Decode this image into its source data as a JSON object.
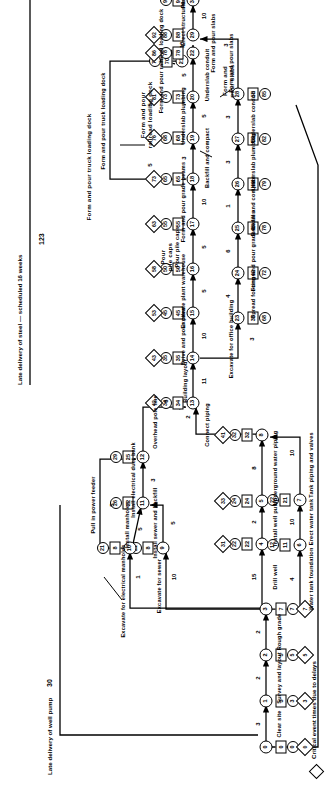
{
  "figure": {
    "type": "pert-cpm-network",
    "orientation": "rotated-90-ccw",
    "legend": {
      "critical_note": "Critical event times due to delays",
      "diamond_symbol": "diamond-marker"
    },
    "annotations": [
      {
        "id": "ann-well-pump",
        "text": "Late delivery of well pump",
        "value": "30"
      },
      {
        "id": "ann-steel",
        "text": "Late delivery of steel — scheduled 16 weeks",
        "value": "123"
      }
    ]
  },
  "events": [
    {
      "n": "0",
      "diamond": "0",
      "circle": "0",
      "square": "0"
    },
    {
      "n": "1",
      "diamond": "3",
      "circle": "3",
      "square": "3"
    },
    {
      "n": "2",
      "diamond": "5",
      "circle": "5",
      "square": "5"
    },
    {
      "n": "3",
      "diamond": "7",
      "circle": "7",
      "square": "7"
    },
    {
      "n": "4",
      "diamond": "31",
      "circle": "22",
      "square": "22"
    },
    {
      "n": "5",
      "diamond": "33",
      "circle": "24",
      "square": "24"
    },
    {
      "n": "6",
      "diamond": "",
      "circle": "12",
      "square": "11"
    },
    {
      "n": "7",
      "diamond": "",
      "circle": "22",
      "square": "21"
    },
    {
      "n": "8",
      "diamond": "41",
      "circle": "32",
      "square": "32"
    },
    {
      "n": "9",
      "diamond": "",
      "circle": "21",
      "square": "8"
    },
    {
      "n": "10",
      "diamond": "",
      "circle": "21",
      "square": "8"
    },
    {
      "n": "11",
      "diamond": "",
      "circle": "26",
      "square": "22"
    },
    {
      "n": "12",
      "diamond": "",
      "circle": "29",
      "square": "25"
    },
    {
      "n": "13",
      "diamond": "42",
      "circle": "34",
      "square": "34"
    },
    {
      "n": "14",
      "diamond": "43",
      "circle": "35",
      "square": "35"
    },
    {
      "n": "15",
      "diamond": "53",
      "circle": "45",
      "square": "45"
    },
    {
      "n": "16",
      "diamond": "58",
      "circle": "50",
      "square": "50"
    },
    {
      "n": "17",
      "diamond": "63",
      "circle": "55",
      "square": "55"
    },
    {
      "n": "18",
      "diamond": "73",
      "circle": "65",
      "square": "65"
    },
    {
      "n": "19",
      "diamond": "76",
      "circle": "68",
      "square": "68"
    },
    {
      "n": "20",
      "diamond": "81",
      "circle": "73",
      "square": "73"
    },
    {
      "n": "21",
      "diamond": "",
      "circle": "78",
      "square": "70"
    },
    {
      "n": "22",
      "diamond": "86",
      "circle": "78",
      "square": "78"
    },
    {
      "n": "23",
      "diamond": "",
      "circle": "68",
      "square": "38"
    },
    {
      "n": "24",
      "diamond": "",
      "circle": "72",
      "square": "42"
    },
    {
      "n": "25",
      "diamond": "",
      "circle": "78",
      "square": "48"
    },
    {
      "n": "26",
      "diamond": "",
      "circle": "79",
      "square": "49"
    },
    {
      "n": "27",
      "diamond": "",
      "circle": "82",
      "square": "52"
    },
    {
      "n": "28",
      "diamond": "",
      "circle": "85",
      "square": "55"
    },
    {
      "n": "29",
      "diamond": "92",
      "circle": "88",
      "square": "88"
    },
    {
      "n": "30",
      "diamond": "",
      "circle": "98",
      "square": "98"
    },
    {
      "n": "31",
      "diamond": "",
      "circle": "113",
      "square": "103"
    }
  ],
  "activities": [
    {
      "from": "0",
      "to": "1",
      "label": "Clear site",
      "duration": "3"
    },
    {
      "from": "1",
      "to": "2",
      "label": "Survey and layout",
      "duration": "2"
    },
    {
      "from": "2",
      "to": "3",
      "label": "Rough grade",
      "duration": "2"
    },
    {
      "from": "3",
      "to": "4",
      "label": "Drill well",
      "duration": "15"
    },
    {
      "from": "4",
      "to": "5",
      "label": "Install well pump",
      "duration": "2"
    },
    {
      "from": "3",
      "to": "6",
      "label": "Water tank foundation",
      "duration": "4"
    },
    {
      "from": "6",
      "to": "7",
      "label": "Erect water tank",
      "duration": "10"
    },
    {
      "from": "5",
      "to": "8",
      "label": "Underground water piping",
      "duration": "8"
    },
    {
      "from": "7",
      "to": "8",
      "label": "Tank piping and valves",
      "duration": "10"
    },
    {
      "from": "3",
      "to": "9",
      "label": "Excavate for sewer",
      "duration": "10"
    },
    {
      "from": "9",
      "to": "11",
      "label": "Install sewer and backfill",
      "duration": "5"
    },
    {
      "from": "3",
      "to": "10",
      "label": "Excavate for electrical manholes",
      "duration": "1"
    },
    {
      "from": "10",
      "to": "11",
      "label": "Install manholes",
      "duration": "5"
    },
    {
      "from": "11",
      "to": "12",
      "label": "Install electrical duct bank",
      "duration": "3"
    },
    {
      "from": "10",
      "to": "12",
      "label": "Pull in power feeder",
      "duration": "5"
    },
    {
      "from": "12",
      "to": "13",
      "label": "Overhead pole line",
      "duration": "6"
    },
    {
      "from": "8",
      "to": "13",
      "label": "Connect piping",
      "duration": "2"
    },
    {
      "from": "13",
      "to": "14",
      "label": "Building layout",
      "duration": "11"
    },
    {
      "from": "14",
      "to": "15",
      "label": "Drive and pour piles",
      "duration": "10"
    },
    {
      "from": "15",
      "to": "16",
      "label": "Excavate plant warehouse",
      "duration": "5"
    },
    {
      "from": "16",
      "to": "17",
      "label": "Pour pile caps",
      "duration": "5"
    },
    {
      "from": "17",
      "to": "18",
      "label": "Form and pour grade beams",
      "duration": "10"
    },
    {
      "from": "18",
      "to": "19",
      "label": "Backfill and compact",
      "duration": "3"
    },
    {
      "from": "19",
      "to": "20",
      "label": "Underslab plumbing",
      "duration": "5"
    },
    {
      "from": "20",
      "to": "22",
      "label": "Underslab conduit",
      "duration": "5"
    },
    {
      "from": "21",
      "to": "22",
      "label": "Form and pour railroad loading dock",
      "duration": "5"
    },
    {
      "from": "18",
      "to": "21",
      "label": "Form and pour truck loading dock",
      "duration": "5"
    },
    {
      "from": "14",
      "to": "23",
      "label": "Excavate for office building",
      "duration": "3"
    },
    {
      "from": "23",
      "to": "24",
      "label": "Spread footings",
      "duration": "4"
    },
    {
      "from": "24",
      "to": "25",
      "label": "Form and pour grade beams",
      "duration": "6"
    },
    {
      "from": "25",
      "to": "26",
      "label": "Backfill and compact",
      "duration": "1"
    },
    {
      "from": "26",
      "to": "27",
      "label": "Underslab plumbing",
      "duration": "3"
    },
    {
      "from": "27",
      "to": "28",
      "label": "Underslab conduit",
      "duration": "3"
    },
    {
      "from": "28",
      "to": "29",
      "label": "Form and pour slabs",
      "duration": "3"
    },
    {
      "from": "22",
      "to": "29",
      "label": "Form and pour slabs",
      "duration": "10"
    },
    {
      "from": "29",
      "to": "30",
      "label": "Erect structural steel",
      "duration": "10"
    },
    {
      "from": "30",
      "to": "31",
      "label": "Plumb and bolt steel",
      "duration": "15"
    }
  ],
  "text_labels": {
    "t_truck_dock": "Form and pour truck loading dock",
    "t_rail_dock": "Form and pour\nrailroad loading dock",
    "t_pile_caps": "Pour\npile caps",
    "t_drive_piles": "Drive and\npour piles",
    "t_exc_warehouse": "Excavate\nplant warehouse",
    "t_bldg_layout": "Building\nlayout",
    "t_exc_office": "Excavate\nfor office\nbuilding",
    "t_spread_ftg": "Spread\nfootings",
    "t_grade_beams_low": "Form and\npour grade\nbeams",
    "t_grade_beams_up": "Form and pour\ngrade beams",
    "t_backfill_up": "Backfill\nand compact",
    "t_underslab_plumb_low": "Underslab plumbing",
    "t_underslab_plumb_up": "Underslab plumbing",
    "t_underslab_conduit": "Underslab\nconduit",
    "t_slabs_up": "Form and\npour slabs",
    "t_slabs_low": "Form and\npour slabs",
    "t_erect_steel": "Erect\nstructural\nsteel",
    "t_plumb_bolt": "Plumb\nand bolt\nsteel",
    "t_drill_well": "Drill well",
    "t_install_pump": "Install\nwell\npump",
    "t_water_found": "Water\ntank\nfoundation",
    "t_erect_tank": "Erect\nwater\ntank",
    "t_ug_water": "Underground\nwater piping",
    "t_tank_piping": "Tank\npiping and\nvalves",
    "t_connect_piping": "Connect\npiping",
    "t_exc_sewer": "Excavate\nfor\nsewer",
    "t_install_sewer": "Install sewer\nand backfill",
    "t_exc_manholes": "Excavate\nfor\nelectrical\nmanholes",
    "t_install_manholes": "Install\nmanholes",
    "t_duct_bank": "Install electrical\nduct bank",
    "t_power_feeder": "Pull in\npower\nfeeder",
    "t_pole_line": "Overhead  pole line",
    "t_clear_site": "Clear\nsite",
    "t_survey": "Survey\nand\nlayout",
    "t_rough_grade": "Rough\ngrade"
  }
}
